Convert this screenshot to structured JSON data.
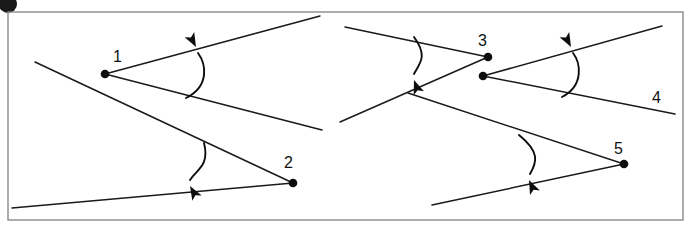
{
  "figure": {
    "background_color": "#ffffff",
    "ink_color": "#0d0d0d",
    "frame_color": "#8a8a8a",
    "width": 698,
    "height": 232,
    "frame": {
      "x": 8,
      "y": 12,
      "width": 675,
      "height": 208
    },
    "corner_mark": {
      "cx": 8,
      "cy": 4,
      "r": 9
    }
  },
  "labels": {
    "one": "1",
    "two": "2",
    "three": "3",
    "four": "4",
    "five": "5"
  },
  "label_positions": {
    "one": {
      "x": 113,
      "y": 62
    },
    "two": {
      "x": 284,
      "y": 168
    },
    "three": {
      "x": 478,
      "y": 46
    },
    "four": {
      "x": 652,
      "y": 103
    },
    "five": {
      "x": 614,
      "y": 154
    }
  },
  "vertices": [
    {
      "name": "vertex-1",
      "label": "1",
      "x": 105,
      "y": 74
    },
    {
      "name": "vertex-2",
      "label": "2",
      "x": 293,
      "y": 183
    },
    {
      "name": "vertex-3",
      "label": "3",
      "x": 488,
      "y": 57
    },
    {
      "name": "vertex-4",
      "label": "4",
      "x": 483,
      "y": 76
    },
    {
      "name": "vertex-5",
      "label": "5",
      "x": 624,
      "y": 164
    }
  ],
  "rays": [
    {
      "name": "ray-1-upper",
      "x1": 105,
      "y1": 74,
      "x2": 320,
      "y2": 16
    },
    {
      "name": "ray-1-lower",
      "x1": 105,
      "y1": 74,
      "x2": 322,
      "y2": 130
    },
    {
      "name": "line-left-diagonal",
      "x1": 35,
      "y1": 62,
      "x2": 293,
      "y2": 183
    },
    {
      "name": "ray-2-baseline",
      "x1": 12,
      "y1": 208,
      "x2": 293,
      "y2": 183
    },
    {
      "name": "ray-3-upper",
      "x1": 488,
      "y1": 57,
      "x2": 345,
      "y2": 27
    },
    {
      "name": "line-3-diagonal",
      "x1": 488,
      "y1": 57,
      "x2": 340,
      "y2": 122
    },
    {
      "name": "ray-4-upper",
      "x1": 483,
      "y1": 76,
      "x2": 662,
      "y2": 26
    },
    {
      "name": "ray-4-lower",
      "x1": 483,
      "y1": 76,
      "x2": 675,
      "y2": 114
    },
    {
      "name": "line-5-diagonal",
      "x1": 624,
      "y1": 164,
      "x2": 408,
      "y2": 93
    },
    {
      "name": "ray-5-baseline",
      "x1": 624,
      "y1": 164,
      "x2": 432,
      "y2": 205
    }
  ],
  "angle_arcs": [
    {
      "name": "angle-arc-1",
      "for_label": "1",
      "direction": "counterclockwise-up",
      "arrow_point": {
        "x": 196,
        "y": 47
      },
      "path": "M 186 98 C 210 86 206 64 198 53",
      "arrow_rotation": -28
    },
    {
      "name": "angle-arc-2",
      "for_label": "2",
      "direction": "clockwise-down",
      "arrow_point": {
        "x": 190,
        "y": 186
      },
      "path": "M 204 143 C 210 166 196 170 190 180",
      "arrow_rotation": 150
    },
    {
      "name": "angle-arc-3",
      "for_label": "3",
      "direction": "clockwise-down",
      "arrow_point": {
        "x": 414,
        "y": 80
      },
      "path": "M 414 37 C 428 56 420 63 414 74",
      "arrow_rotation": 160
    },
    {
      "name": "angle-arc-4",
      "for_label": "4",
      "direction": "counterclockwise-up",
      "arrow_point": {
        "x": 571,
        "y": 47
      },
      "path": "M 562 97 C 585 85 580 62 573 53",
      "arrow_rotation": -28
    },
    {
      "name": "angle-arc-5",
      "for_label": "5",
      "direction": "clockwise-down",
      "arrow_point": {
        "x": 529,
        "y": 180
      },
      "path": "M 519 135 C 540 152 537 162 530 174",
      "arrow_rotation": 155
    }
  ]
}
